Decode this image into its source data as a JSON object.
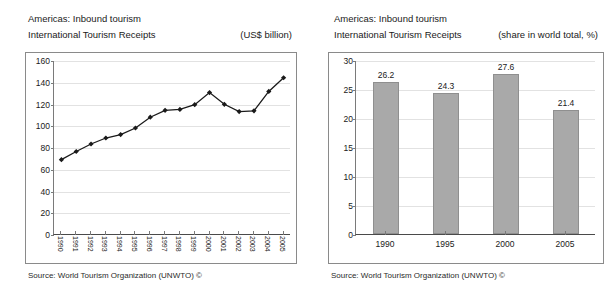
{
  "charts": [
    {
      "header_line1": "Americas: Inbound tourism",
      "header_line2": "International Tourism Receipts",
      "header_unit": "(US$ billion)",
      "source": "Source: World Tourism Organization (UNWTO) ©",
      "chart_data": {
        "type": "line",
        "title": "Americas: Inbound tourism — International Tourism Receipts",
        "subtitle": "International Tourism Receipts",
        "xlabel": "",
        "ylabel": "",
        "unit": "US$ billion",
        "grid": true,
        "legend": "none",
        "ylim": [
          0,
          160
        ],
        "yticks": [
          0,
          20,
          40,
          60,
          80,
          100,
          120,
          140,
          160
        ],
        "categories": [
          "1990",
          "1991",
          "1992",
          "1993",
          "1994",
          "1995",
          "1996",
          "1997",
          "1998",
          "1999",
          "2000",
          "2001",
          "2002",
          "2003",
          "2004",
          "2005"
        ],
        "values": [
          69.3,
          76.8,
          83.7,
          89.2,
          92.3,
          98.4,
          108.3,
          114.6,
          115.5,
          119.8,
          131.0,
          120.2,
          113.5,
          114.2,
          132.0,
          144.6
        ],
        "marker": "diamond",
        "line_color": "#1a1a1a",
        "marker_color": "#1a1a1a"
      }
    },
    {
      "header_line1": "Americas: Inbound tourism",
      "header_line2": "International Tourism Receipts",
      "header_unit": "(share in world total, %)",
      "source": "Source: World Tourism Organization (UNWTO) ©",
      "chart_data": {
        "type": "bar",
        "title": "Americas: Inbound tourism — International Tourism Receipts",
        "subtitle": "International Tourism Receipts",
        "xlabel": "",
        "ylabel": "",
        "unit": "share in world total, %",
        "grid": true,
        "legend": "none",
        "ylim": [
          0,
          30
        ],
        "yticks": [
          0,
          5,
          10,
          15,
          20,
          25,
          30
        ],
        "categories": [
          "1990",
          "1995",
          "2000",
          "2005"
        ],
        "values": [
          26.2,
          24.3,
          27.6,
          21.4
        ],
        "data_labels": [
          "26.2",
          "24.3",
          "27.6",
          "21.4"
        ],
        "bar_color": "#a9a9a9",
        "bar_border_color": "#8f8f8f"
      }
    }
  ]
}
